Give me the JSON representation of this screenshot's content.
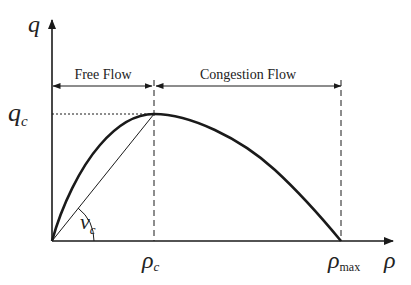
{
  "diagram": {
    "y_axis_label": "q",
    "x_axis_label": "ρ",
    "labels": {
      "qc_main": "q",
      "qc_sub": "c",
      "rhoc_main": "ρ",
      "rhoc_sub": "c",
      "rhomax_main": "ρ",
      "rhomax_sub": "max",
      "vc_main": "v",
      "vc_sub": "c"
    },
    "regions": [
      {
        "label": "Free Flow",
        "from": "0",
        "to": "ρc"
      },
      {
        "label": "Congestion Flow",
        "from": "ρc",
        "to": "ρmax"
      }
    ],
    "curve": {
      "shape": "concave parabola from origin to (ρmax, 0), peak at (ρc, qc)",
      "stroke_color": "#1a1a1a"
    },
    "secant_line": "line from origin to peak (ρc, qc), slope vc",
    "angle_label": "vc",
    "colors": {
      "ink": "#1a1a1a",
      "background": "#ffffff"
    }
  }
}
